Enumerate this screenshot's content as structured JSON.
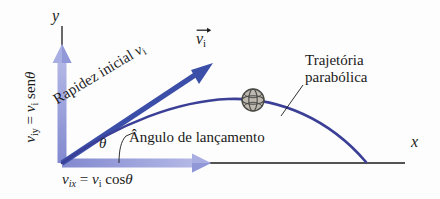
{
  "figure": {
    "background_color": "#fdfdfd",
    "axes": {
      "y_label": "y",
      "x_label": "x",
      "axis_color": "#1a1a1a",
      "origin": {
        "x": 62,
        "y": 163
      }
    },
    "colors": {
      "component_arrow": "#9ea4dc",
      "component_arrow_edge": "#7b83cc",
      "vector_arrow": "#3c4fa8",
      "trajectory": "#3b3f96",
      "leader_line": "#1a1a1a",
      "text": "#1a1a1a",
      "ball_outline": "#4a4a46",
      "ball_fill": "#b9b5ad"
    },
    "labels": {
      "vertical_component": {
        "var": "v",
        "var_sub": "iy",
        "equals": "=",
        "rhs_var": "v",
        "rhs_sub": "i",
        "func": "sen",
        "angle": "θ",
        "plain": "v_iy = v_i sen θ"
      },
      "horizontal_component": {
        "var": "v",
        "var_sub": "ix",
        "equals": "=",
        "rhs_var": "v",
        "rhs_sub": "i",
        "func": "cos",
        "angle": "θ",
        "plain": "v_ix = v_i cos θ"
      },
      "initial_speed": {
        "text": "Rapidez inicial",
        "var": "v",
        "var_sub": "i",
        "plain": "Rapidez inicial v_i"
      },
      "velocity_vector": {
        "var": "v",
        "var_sub": "i",
        "plain": "v⃗_i"
      },
      "theta": "θ",
      "launch_angle": "Ângulo de lançamento",
      "trajectory_line1": "Trajetória",
      "trajectory_line2": "parabólica"
    },
    "ball": {
      "name": "basketball",
      "center_x": 253,
      "center_y": 100,
      "radius": 11
    }
  }
}
